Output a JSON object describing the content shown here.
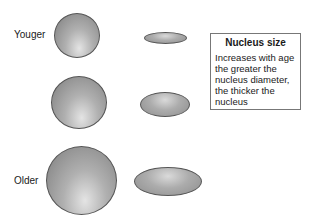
{
  "labels": {
    "younger": "Youger",
    "older": "Older"
  },
  "info_box": {
    "title": "Nucleus size",
    "body": "Increases with age the greater the nucleus diameter, the thicker the nucleus"
  },
  "rows": [
    {
      "stage": "young",
      "sphere_diameter_px": 46,
      "disc_width_px": 43,
      "disc_height_px": 12
    },
    {
      "stage": "middle",
      "sphere_diameter_px": 56,
      "disc_width_px": 50,
      "disc_height_px": 25
    },
    {
      "stage": "old",
      "sphere_diameter_px": 70,
      "disc_width_px": 68,
      "disc_height_px": 29
    }
  ],
  "colors": {
    "shape_border": "#555555",
    "shape_fill": "#9a9a9a",
    "box_border": "#777777"
  }
}
